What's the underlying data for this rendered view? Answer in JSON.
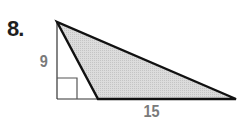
{
  "problem": {
    "number": "8.",
    "labels": {
      "height": "9",
      "base": "15"
    }
  },
  "figure": {
    "type": "right-triangle-with-shaded-obtuse-triangle",
    "shade_color": "#d4d4d4",
    "stroke_color": "#111111",
    "thin_stroke_color": "#333333"
  }
}
